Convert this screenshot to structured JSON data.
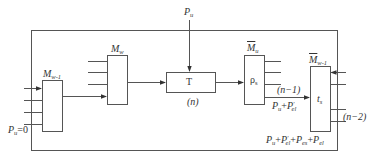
{
  "diagram": {
    "type": "block-flow",
    "colors": {
      "line": "#555555",
      "text": "#333333",
      "background": "#ffffff"
    },
    "top_input": {
      "label_main": "P",
      "label_sub": "u"
    },
    "blocks": [
      {
        "id": "m_w_minus_1",
        "label_main": "M",
        "label_sub": "w-1",
        "overbar": false,
        "inner": ""
      },
      {
        "id": "m_w",
        "label_main": "M",
        "label_sub": "w",
        "overbar": false,
        "inner": ""
      },
      {
        "id": "t",
        "label_main": "",
        "label_sub": "",
        "overbar": false,
        "inner": "T"
      },
      {
        "id": "rho_s",
        "label_main": "M",
        "label_sub": "u",
        "overbar": true,
        "inner_main": "ρ",
        "inner_sub": "s"
      },
      {
        "id": "t_s",
        "label_main": "M",
        "label_sub": "w-1",
        "overbar": true,
        "inner_main": "t",
        "inner_sub": "s"
      }
    ],
    "annotations": {
      "n": "(n)",
      "n_minus_1": "(n−1)",
      "n_minus_2": "(n−2)",
      "pu_zero": {
        "main": "P",
        "sub": "u",
        "rest": "=0"
      },
      "pu_plus_pel": {
        "p1": "P",
        "s1": "u",
        "plus": "+",
        "p2": "P",
        "sup2": "′",
        "s2": "el"
      },
      "total": {
        "p1": "P",
        "s1": "u",
        "p2": "P",
        "sup2": "′",
        "s2": "el",
        "p3": "P",
        "s3": "es",
        "p4": "P",
        "s4": "el",
        "plus": "+"
      }
    }
  }
}
